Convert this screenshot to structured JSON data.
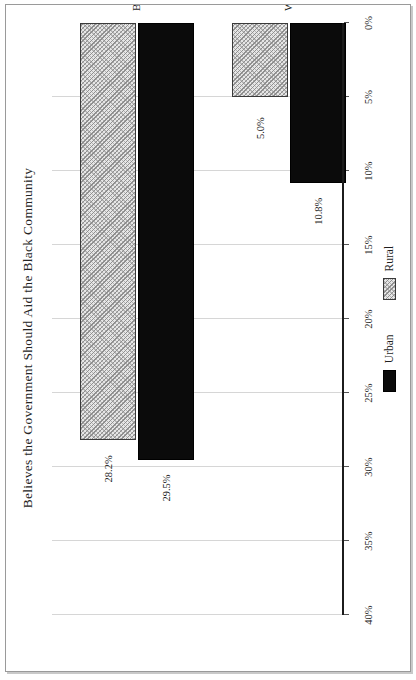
{
  "chart_data": {
    "type": "bar",
    "orientation": "horizontal",
    "rotation_degrees": -90,
    "title": "Believes the Government Should Aid the Black Community",
    "xlabel": "",
    "ylabel": "",
    "categories": [
      "Whites",
      "Blacks & Other"
    ],
    "series": [
      {
        "name": "Urban",
        "values": [
          10.8,
          29.5
        ],
        "labels": [
          "10.8%",
          "5.0%"
        ],
        "fill": "solid-black",
        "color": "#0b0b0b"
      },
      {
        "name": "Rural",
        "values": [
          5.0,
          28.2
        ],
        "labels": [
          "5.0%",
          "28.2%"
        ],
        "fill": "diagonal-hatch",
        "color": "#e6e6e6"
      }
    ],
    "bars": [
      {
        "category": "Whites",
        "series": "Urban",
        "value": 10.8,
        "label": "10.8%"
      },
      {
        "category": "Whites",
        "series": "Rural",
        "value": 5.0,
        "label": "5.0%"
      },
      {
        "category": "Blacks & Other",
        "series": "Urban",
        "value": 29.5,
        "label": "29.5%"
      },
      {
        "category": "Blacks & Other",
        "series": "Rural",
        "value": 28.2,
        "label": "28.2%"
      }
    ],
    "value_axis": {
      "min": 0,
      "max": 40,
      "tick_values": [
        0,
        5,
        10,
        15,
        20,
        25,
        30,
        35,
        40
      ],
      "tick_labels": [
        "0%",
        "5%",
        "10%",
        "15%",
        "20%",
        "25%",
        "30%",
        "35%",
        "40%"
      ],
      "grid": true
    },
    "legend": {
      "position": "bottom",
      "entries": [
        {
          "label": "Urban",
          "swatch": "solid-black"
        },
        {
          "label": "Rural",
          "swatch": "diagonal-hatch"
        }
      ]
    }
  }
}
